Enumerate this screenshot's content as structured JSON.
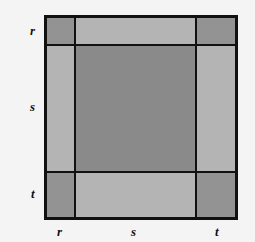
{
  "diagram": {
    "left_labels": [
      "r",
      "s",
      "t"
    ],
    "bottom_labels": [
      "r",
      "s",
      "t"
    ],
    "colors": {
      "corner": "#939393",
      "edge": "#b4b4b4",
      "center": "#8a8a8a",
      "border": "#111111"
    }
  }
}
